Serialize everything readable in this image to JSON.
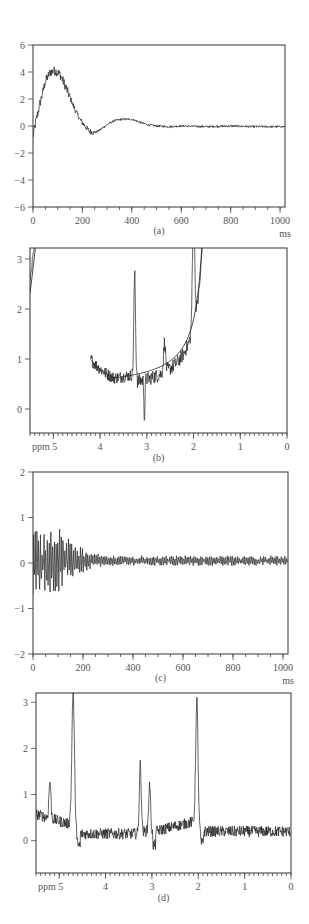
{
  "figure": {
    "panels": [
      "(a)",
      "(b)",
      "(c)",
      "(d)"
    ]
  },
  "chart_data": [
    {
      "id": "a",
      "type": "line",
      "caption": "(a)",
      "title": "",
      "xlabel": "ms",
      "ylabel": "",
      "xlim": [
        0,
        1020
      ],
      "ylim": [
        -6,
        6
      ],
      "xticks": [
        0,
        200,
        400,
        600,
        800,
        1000
      ],
      "xtick_labels": [
        "0",
        "200",
        "400",
        "600",
        "800",
        "1000"
      ],
      "yticks": [
        -6,
        -4,
        -2,
        0,
        2,
        4,
        6
      ],
      "ytick_labels": [
        "-6",
        "-4",
        "-2",
        "0",
        "2",
        "4",
        "6"
      ],
      "grid": false,
      "description": "Noisy damped oscillation (time-domain signal)",
      "series": [
        {
          "name": "signal",
          "x": [
            0,
            10,
            30,
            50,
            70,
            90,
            110,
            130,
            150,
            170,
            190,
            210,
            230,
            250,
            270,
            300,
            330,
            360,
            400,
            430,
            460,
            500,
            550,
            600,
            700,
            800,
            900,
            1020
          ],
          "values": [
            -0.8,
            0.2,
            1.8,
            3.3,
            4.0,
            4.1,
            3.8,
            3.0,
            2.1,
            1.2,
            0.5,
            0.0,
            -0.4,
            -0.5,
            -0.3,
            0.1,
            0.4,
            0.5,
            0.5,
            0.3,
            0.1,
            0.0,
            -0.05,
            0.0,
            -0.05,
            0.0,
            -0.05,
            -0.05
          ]
        }
      ],
      "frame_px": {
        "left": 33,
        "top": 45,
        "right": 285,
        "bottom": 207
      }
    },
    {
      "id": "b",
      "type": "line",
      "caption": "(b)",
      "title": "",
      "xlabel": "ppm",
      "ylabel": "",
      "xlim": [
        5.5,
        0
      ],
      "ylim": [
        -0.48,
        3.22
      ],
      "xticks": [
        5,
        4,
        3,
        2,
        1,
        0
      ],
      "xtick_labels": [
        "ppm 5",
        "4",
        "3",
        "2",
        "1",
        "0"
      ],
      "yticks": [
        0,
        1,
        2,
        3
      ],
      "ytick_labels": [
        "0",
        "1",
        "2",
        "3"
      ],
      "grid": false,
      "description": "Noisy spectrum with large baseline curve and fitted smooth baseline",
      "series": [
        {
          "name": "spectrum",
          "x": [
            5.5,
            4.05,
            3.9,
            3.7,
            3.5,
            3.35,
            3.27,
            3.2,
            3.1,
            3.05,
            2.9,
            2.75,
            2.62,
            2.5,
            2.3,
            2.1,
            2.02,
            1.95,
            1.85,
            1.5,
            1.0,
            0.5,
            0.0
          ],
          "values": [
            2.6,
            3.2,
            2.15,
            1.75,
            1.55,
            1.5,
            2.65,
            0.6,
            1.1,
            0.15,
            0.95,
            0.6,
            1.4,
            0.8,
            0.55,
            0.45,
            2.86,
            0.5,
            0.75,
            0.5,
            0.45,
            0.4,
            0.3
          ]
        },
        {
          "name": "baseline-fit",
          "x": [
            5.5,
            4.05,
            3.9,
            3.6,
            3.4,
            3.0,
            2.5,
            2.0,
            1.5,
            1.0,
            0.5,
            0.0
          ],
          "values": [
            2.3,
            3.2,
            2.1,
            1.6,
            1.42,
            1.05,
            0.8,
            0.66,
            0.58,
            0.52,
            0.48,
            0.45
          ]
        }
      ],
      "frame_px": {
        "left": 30,
        "top": 248,
        "right": 287,
        "bottom": 433
      }
    },
    {
      "id": "c",
      "type": "line",
      "caption": "(c)",
      "title": "",
      "xlabel": "ms",
      "ylabel": "",
      "xlim": [
        0,
        1020
      ],
      "ylim": [
        -2,
        2
      ],
      "xticks": [
        0,
        200,
        400,
        600,
        800,
        1000
      ],
      "xtick_labels": [
        "0",
        "200",
        "400",
        "600",
        "800",
        "1000"
      ],
      "yticks": [
        -2,
        -1,
        0,
        1,
        2
      ],
      "ytick_labels": [
        "-2",
        "-1",
        "0",
        "1",
        "2"
      ],
      "grid": false,
      "description": "Residual high-frequency oscillating signal decaying by ~250 ms, then noise around 0.05",
      "series": [
        {
          "name": "signal",
          "x": [
            0,
            20,
            50,
            100,
            150,
            200,
            250,
            300,
            1020
          ],
          "envelope": [
            0.7,
            0.6,
            0.6,
            0.65,
            0.4,
            0.25,
            0.15,
            0.1,
            0.1
          ],
          "baseline": 0.05,
          "min_at_start": -0.7
        }
      ],
      "frame_px": {
        "left": 33,
        "top": 472,
        "right": 288,
        "bottom": 654
      }
    },
    {
      "id": "d",
      "type": "line",
      "caption": "(d)",
      "title": "",
      "xlabel": "ppm",
      "ylabel": "",
      "xlim": [
        5.5,
        0
      ],
      "ylim": [
        -0.7,
        3.2
      ],
      "xticks": [
        5,
        4,
        3,
        2,
        1,
        0
      ],
      "xtick_labels": [
        "ppm 5",
        "4",
        "3",
        "2",
        "1",
        "0"
      ],
      "yticks": [
        0,
        1,
        2,
        3
      ],
      "ytick_labels": [
        "0",
        "1",
        "2",
        "3"
      ],
      "grid": false,
      "description": "Baseline-corrected spectrum with peaks",
      "peaks": [
        {
          "ppm": 5.2,
          "height": 1.1
        },
        {
          "ppm": 4.7,
          "height": 3.3
        },
        {
          "ppm": 3.25,
          "height": 1.75
        },
        {
          "ppm": 3.05,
          "height": 1.3
        },
        {
          "ppm": 2.03,
          "height": 3.13
        }
      ],
      "baseline_level": 0.2,
      "frame_px": {
        "left": 36,
        "top": 693,
        "right": 291,
        "bottom": 873
      }
    }
  ]
}
